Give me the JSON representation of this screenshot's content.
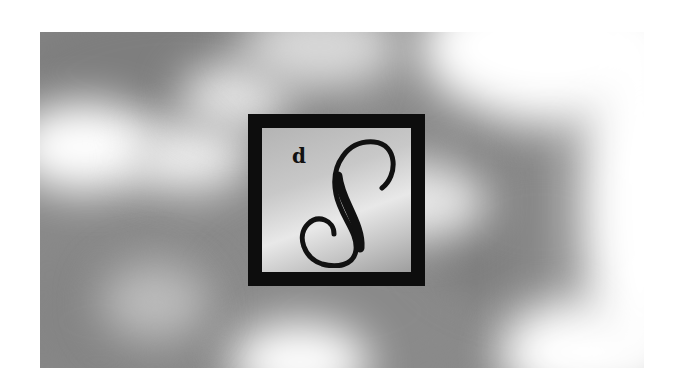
{
  "image": {
    "description": "Blurred grayscale cloud photograph with a black square-framed monogram logo in the center",
    "background_color": "#ffffff",
    "photo_tone": "grayscale",
    "logo": {
      "small_letter": "d",
      "large_letter": "S",
      "frame_color": "#0d0d0d",
      "letter_color": "#111111"
    }
  }
}
